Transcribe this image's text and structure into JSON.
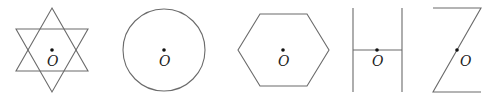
{
  "figure": {
    "stroke_color": "#6b6b6b",
    "dot_color": "#111111",
    "panels": [
      {
        "id": "hexagram",
        "shape": "six-pointed star (two overlapping triangles)",
        "center_label": "O"
      },
      {
        "id": "circle",
        "shape": "circle",
        "center_label": "O"
      },
      {
        "id": "hexagon",
        "shape": "regular hexagon",
        "center_label": "O"
      },
      {
        "id": "letter-h",
        "shape": "letter H",
        "center_label": "O"
      },
      {
        "id": "letter-z",
        "shape": "letter Z",
        "center_label": "O"
      }
    ]
  }
}
